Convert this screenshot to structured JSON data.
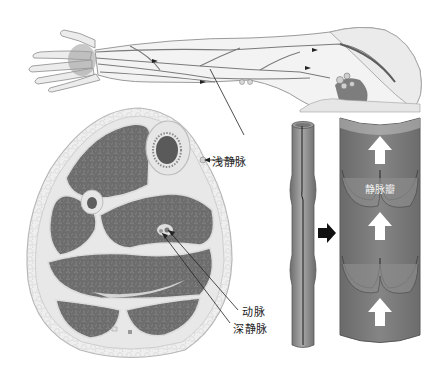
{
  "figure": {
    "type": "anatomical-illustration",
    "colors": {
      "background": "#ffffff",
      "muscle": "#6f6f6f",
      "fascia": "#e4e4e4",
      "skin_fat": "#ececec",
      "vein_tube": "#8e8e8e",
      "vein_interior": "#7a7a7a",
      "arrow_white": "#ffffff",
      "arrow_black": "#111111",
      "leader_line": "#222222"
    }
  },
  "labels": {
    "superficial_vein": "浅静脉",
    "artery": "动脉",
    "deep_vein": "深静脉",
    "venous_valve": "静脉瓣"
  },
  "panels": [
    {
      "id": "arm",
      "description": "arm and hand with superficial veins and flow arrows"
    },
    {
      "id": "cross-section",
      "description": "transverse section of limb showing muscles, bones, artery and veins"
    },
    {
      "id": "vein-tube",
      "description": "external view of vein with valve bulges"
    },
    {
      "id": "vein-interior",
      "description": "opened vein showing valves and upward blood flow arrows"
    }
  ]
}
